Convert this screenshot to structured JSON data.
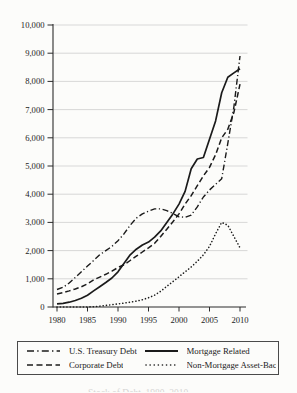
{
  "chart_data": {
    "type": "line",
    "title": "",
    "xlabel": "",
    "ylabel": "",
    "x": [
      1980,
      1981,
      1982,
      1983,
      1984,
      1985,
      1986,
      1987,
      1988,
      1989,
      1990,
      1991,
      1992,
      1993,
      1994,
      1995,
      1996,
      1997,
      1998,
      1999,
      2000,
      2001,
      2002,
      2003,
      2004,
      2005,
      2006,
      2007,
      2008,
      2009,
      2010
    ],
    "series": [
      {
        "name": "U.S. Treasury Debt",
        "style": "dashdot",
        "values": [
          620,
          700,
          850,
          1050,
          1250,
          1450,
          1650,
          1850,
          2000,
          2150,
          2350,
          2600,
          2900,
          3150,
          3300,
          3400,
          3480,
          3480,
          3420,
          3320,
          3200,
          3180,
          3260,
          3550,
          3900,
          4150,
          4350,
          4550,
          5800,
          7100,
          8900
        ]
      },
      {
        "name": "Corporate Debt",
        "style": "dashed",
        "values": [
          460,
          510,
          570,
          640,
          720,
          820,
          960,
          1060,
          1160,
          1270,
          1400,
          1500,
          1650,
          1800,
          1950,
          2100,
          2260,
          2500,
          2760,
          3020,
          3300,
          3650,
          3950,
          4300,
          4650,
          4950,
          5400,
          6000,
          6300,
          6900,
          7900
        ]
      },
      {
        "name": "Mortgage Related",
        "style": "solid",
        "values": [
          110,
          130,
          170,
          230,
          310,
          420,
          570,
          720,
          870,
          1030,
          1250,
          1550,
          1850,
          2050,
          2200,
          2300,
          2480,
          2700,
          3000,
          3300,
          3650,
          4100,
          4900,
          5250,
          5300,
          5950,
          6600,
          7600,
          8150,
          8300,
          8450
        ]
      },
      {
        "name": "Non-Mortgage Asset-Backed",
        "style": "dotted",
        "values": [
          0,
          0,
          0,
          0,
          1,
          1,
          10,
          30,
          55,
          80,
          110,
          140,
          170,
          210,
          260,
          330,
          420,
          560,
          730,
          900,
          1070,
          1250,
          1420,
          1620,
          1850,
          2150,
          2600,
          3000,
          2900,
          2500,
          2100
        ]
      }
    ],
    "xlim": [
      1980,
      2010
    ],
    "ylim": [
      0,
      10000
    ],
    "x_ticks": [
      1980,
      1985,
      1990,
      1995,
      2000,
      2005,
      2010
    ],
    "x_tick_labels": [
      "1980",
      "1985",
      "1990",
      "1995",
      "2000",
      "2005",
      "2010"
    ],
    "y_ticks": [
      0,
      1000,
      2000,
      3000,
      4000,
      5000,
      6000,
      7000,
      8000,
      9000,
      10000
    ],
    "y_tick_labels": [
      "0",
      "1,000",
      "2,000",
      "3,000",
      "4,000",
      "5,000",
      "6,000",
      "7,000",
      "8,000",
      "9,000",
      "10,000"
    ],
    "grid": "horizontal",
    "legend_position": "bottom-box"
  },
  "legend": {
    "items": [
      {
        "label": "U.S. Treasury Debt",
        "line_style": "dash-dot"
      },
      {
        "label": "Corporate Debt",
        "line_style": "dashed"
      },
      {
        "label": "Mortgage Related",
        "line_style": "solid"
      },
      {
        "label": "Non-Mortgage Asset-Backed",
        "line_style": "dotted"
      }
    ]
  },
  "footer": {
    "caption_fragment": "Stock of Debt, 1980–2010"
  },
  "colors": {
    "line": "#1b1b1b",
    "grid": "#c9c9c9",
    "axis": "#2b2b2b",
    "background": "#fcfcfa"
  }
}
